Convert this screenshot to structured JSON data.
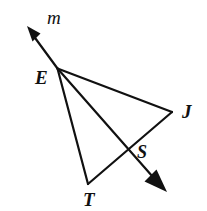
{
  "figure": {
    "background_color": "#ffffff",
    "stroke_color": "#111111",
    "width": 207,
    "height": 211,
    "labels": {
      "ray_m": "m",
      "vertex_e": "E",
      "vertex_j": "J",
      "vertex_s": "S",
      "vertex_t": "T"
    },
    "label_positions": {
      "ray_m": {
        "x": 47,
        "y": 24,
        "font_size": 19
      },
      "vertex_e": {
        "x": 35,
        "y": 84,
        "font_size": 19
      },
      "vertex_j": {
        "x": 182,
        "y": 118,
        "font_size": 19
      },
      "vertex_s": {
        "x": 137,
        "y": 158,
        "font_size": 18
      },
      "vertex_t": {
        "x": 83,
        "y": 206,
        "font_size": 19
      }
    },
    "points": {
      "E": {
        "x": 57.5,
        "y": 68.5
      },
      "J": {
        "x": 172.0,
        "y": 112.0
      },
      "S": {
        "x": 130.0,
        "y": 150.0
      },
      "T": {
        "x": 88.0,
        "y": 184.0
      },
      "m_arrow_tip": {
        "x": 27.0,
        "y": 26.0
      },
      "ray_arrow_tip": {
        "x": 167.0,
        "y": 192.0
      }
    },
    "segments": [
      {
        "name": "ray-m",
        "from": "E",
        "to": "m_arrow_tip",
        "arrow": true
      },
      {
        "name": "segment-ej",
        "from": "E",
        "to": "J",
        "arrow": false
      },
      {
        "name": "ray-e-through-s",
        "from": "E",
        "to": "ray_arrow_tip",
        "arrow": true
      },
      {
        "name": "segment-et",
        "from": "E",
        "to": "T",
        "arrow": false
      },
      {
        "name": "segment-tj",
        "from": "T",
        "to": "J",
        "arrow": false
      }
    ],
    "stroke_width": 2.2
  }
}
